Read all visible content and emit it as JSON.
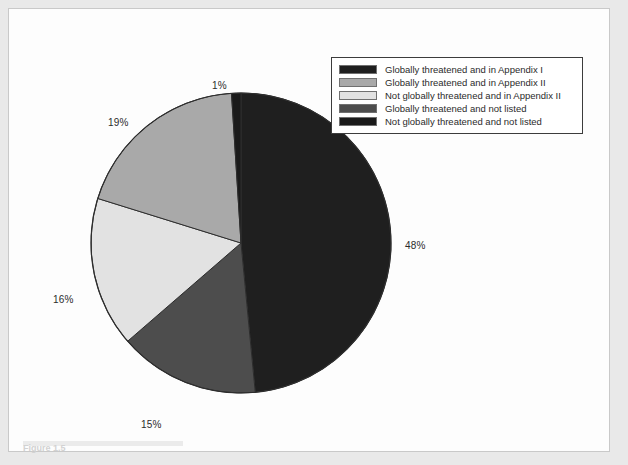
{
  "figure": {
    "caption_fragment": "Figure 1.5",
    "background_color": "#e9e9e9",
    "panel_color": "#fdfdfd",
    "frame_color": "#c9c9c9"
  },
  "legend": {
    "position": "top-right",
    "border_color": "#3c3c3c",
    "items": [
      {
        "label": "Globally threatened and in Appendix I",
        "color": "#1f1f1f"
      },
      {
        "label": "Globally threatened and in Appendix II",
        "color": "#a9a9a9"
      },
      {
        "label": "Not globally threatened and in Appendix II",
        "color": "#e2e2e2"
      },
      {
        "label": "Globally threatened and not listed",
        "color": "#4d4d4d"
      },
      {
        "label": "Not globally threatened and not listed",
        "color": "#1a1a1a"
      }
    ]
  },
  "chart_data": {
    "type": "pie",
    "title": "",
    "subtitle": "",
    "xlabel": "",
    "ylabel": "",
    "grid": false,
    "legend_position": "top-right",
    "start_angle_deg": 0,
    "direction": "clockwise",
    "labels": [
      "Globally threatened and in Appendix I",
      "Globally threatened and not listed",
      "Not globally threatened and in Appendix II",
      "Globally threatened and in Appendix II",
      "Not globally threatened and not listed"
    ],
    "values": [
      48,
      15,
      16,
      19,
      1
    ],
    "data_labels": [
      "48%",
      "15%",
      "16%",
      "19%",
      "1%"
    ],
    "colors": [
      "#1f1f1f",
      "#4d4d4d",
      "#e2e2e2",
      "#a9a9a9",
      "#1a1a1a"
    ],
    "slice_order_from_12_oclock_clockwise": [
      {
        "label": "Globally threatened and in Appendix I",
        "value": 48,
        "display": "48%",
        "color": "#1f1f1f"
      },
      {
        "label": "Globally threatened and not listed",
        "value": 15,
        "display": "15%",
        "color": "#4d4d4d"
      },
      {
        "label": "Not globally threatened and in Appendix II",
        "value": 16,
        "display": "16%",
        "color": "#e2e2e2"
      },
      {
        "label": "Globally threatened and in Appendix II",
        "value": 19,
        "display": "19%",
        "color": "#a9a9a9"
      },
      {
        "label": "Not globally threatened and not listed",
        "value": 1,
        "display": "1%",
        "color": "#1a1a1a"
      }
    ],
    "total": 99,
    "units": "percent"
  }
}
